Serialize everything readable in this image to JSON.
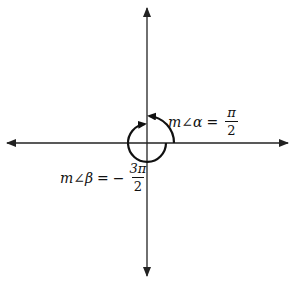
{
  "diagram": {
    "type": "angle-diagram",
    "axes": {
      "color": "#222222",
      "center": [
        147,
        143
      ]
    },
    "angles": [
      {
        "id": "alpha",
        "prefix": "m∠",
        "symbol": "α",
        "equals": "=",
        "sign": "",
        "numerator": "π",
        "denominator": "2",
        "direction": "counterclockwise",
        "from": "positive x-axis",
        "to": "positive y-axis"
      },
      {
        "id": "beta",
        "prefix": "m∠",
        "symbol": "β",
        "equals": "=",
        "sign": "−",
        "numerator": "3π",
        "denominator": "2",
        "direction": "clockwise",
        "from": "positive x-axis",
        "to": "positive y-axis"
      }
    ]
  }
}
